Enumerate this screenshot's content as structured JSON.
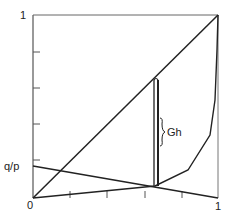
{
  "diagram": {
    "axis_labels": {
      "y_top": "1",
      "origin": "0",
      "x_right": "1",
      "q_over_p": "q/p"
    },
    "annotation": {
      "gap_label": "Gh"
    },
    "colors": {
      "line": "#222222",
      "frame": "#555555",
      "background": "#ffffff"
    }
  }
}
